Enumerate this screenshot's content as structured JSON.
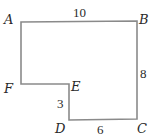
{
  "diagram": {
    "type": "polygon",
    "stroke_color": "#8a8a8a",
    "fill_color": "#ffffff",
    "vertices": [
      {
        "name": "A",
        "x": 21,
        "y": 22
      },
      {
        "name": "B",
        "x": 137,
        "y": 21
      },
      {
        "name": "C",
        "x": 137,
        "y": 119
      },
      {
        "name": "D",
        "x": 69,
        "y": 120
      },
      {
        "name": "E",
        "x": 69,
        "y": 84
      },
      {
        "name": "F",
        "x": 21,
        "y": 84
      }
    ],
    "vertex_labels": {
      "A": "A",
      "B": "B",
      "C": "C",
      "D": "D",
      "E": "E",
      "F": "F"
    },
    "edge_lengths": {
      "AB": "10",
      "BC": "8",
      "DE": "3",
      "DC": "6"
    }
  }
}
